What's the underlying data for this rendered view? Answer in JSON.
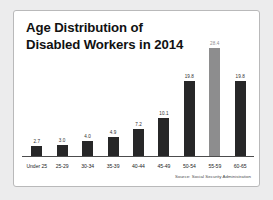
{
  "card": {
    "title": "Age Distribution of\nDisabled Workers in 2014",
    "title_line1": "Age Distribution of",
    "title_line2": "Disabled Workers in 2014",
    "source": "Source: Social Security Administration"
  },
  "colors": {
    "bar": "#272728",
    "bar_highlight": "#8d8d8e",
    "page_background": "#ececed",
    "card_background": "#ffffff",
    "card_border": "#b9b9ba",
    "text": "#111112"
  },
  "chart_data": {
    "type": "bar",
    "title": "Age Distribution of Disabled Workers in 2014",
    "xlabel": "",
    "ylabel": "",
    "ylim": [
      0,
      28.4
    ],
    "grid": false,
    "legend": "none",
    "source": "Source: Social Security Administration",
    "categories": [
      "Under 25",
      "25-29",
      "30-34",
      "35-39",
      "40-44",
      "45-49",
      "50-54",
      "55-59",
      "60-65"
    ],
    "values": [
      2.7,
      3.0,
      4.0,
      4.9,
      7.2,
      10.1,
      19.8,
      28.4,
      19.8
    ],
    "value_labels": [
      "2.7",
      "3.0",
      "4.0",
      "4.9",
      "7.2",
      "10.1",
      "19.8",
      "28.4",
      "19.8"
    ],
    "highlight_index": 7,
    "bars": [
      {
        "category": "Under 25",
        "value": 2.7,
        "label": "2.7",
        "highlight": false
      },
      {
        "category": "25-29",
        "value": 3.0,
        "label": "3.0",
        "highlight": false
      },
      {
        "category": "30-34",
        "value": 4.0,
        "label": "4.0",
        "highlight": false
      },
      {
        "category": "35-39",
        "value": 4.9,
        "label": "4.9",
        "highlight": false
      },
      {
        "category": "40-44",
        "value": 7.2,
        "label": "7.2",
        "highlight": false
      },
      {
        "category": "45-49",
        "value": 10.1,
        "label": "10.1",
        "highlight": false
      },
      {
        "category": "50-54",
        "value": 19.8,
        "label": "19.8",
        "highlight": false
      },
      {
        "category": "55-59",
        "value": 28.4,
        "label": "28.4",
        "highlight": true
      },
      {
        "category": "60-65",
        "value": 19.8,
        "label": "19.8",
        "highlight": false
      }
    ]
  }
}
